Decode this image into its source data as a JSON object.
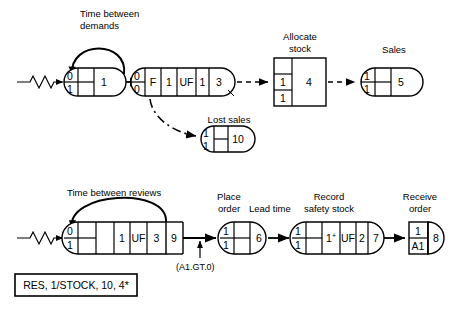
{
  "diagram": {
    "type": "activity-network",
    "labels": {
      "time_between_demands": "Time between\ndemands",
      "time_between_demands_l1": "Time between",
      "time_between_demands_l2": "demands",
      "allocate_stock_l1": "Allocate",
      "allocate_stock_l2": "stock",
      "sales": "Sales",
      "lost_sales": "Lost sales",
      "time_between_reviews": "Time between reviews",
      "place_order_l1": "Place",
      "place_order_l2": "order",
      "lead_time": "Lead time",
      "record_safety_stock_l1": "Record",
      "record_safety_stock_l2": "safety stock",
      "receive_order_l1": "Receive",
      "receive_order_l2": "order",
      "condition": "(A1.GT.0)",
      "resource_block": "RES, 1/STOCK, 10, 4*"
    },
    "nodes": [
      {
        "id": "demand-source",
        "name": "demand-source-node",
        "shape": "rounded-both",
        "row": "top",
        "top_left": "0",
        "bottom_left": "1",
        "cells": [
          "",
          "1"
        ],
        "label": "Time between demands",
        "self_loop": true
      },
      {
        "id": "demand-queue",
        "name": "demand-queue-node",
        "shape": "rounded-both",
        "row": "top",
        "top_left": "0",
        "bottom_left": "0",
        "cells": [
          "F",
          "1",
          "UF",
          "1",
          "3"
        ]
      },
      {
        "id": "allocate-stock",
        "name": "allocate-stock-node",
        "shape": "rectangle",
        "row": "top",
        "left_cells": [
          "",
          "1",
          "1"
        ],
        "right_cell": "4",
        "label": "Allocate stock"
      },
      {
        "id": "sales",
        "name": "sales-node",
        "shape": "rounded-both",
        "row": "top",
        "top_left": "1",
        "bottom_left": "1",
        "cells": [
          "",
          "5"
        ],
        "label": "Sales"
      },
      {
        "id": "lost-sales",
        "name": "lost-sales-node",
        "shape": "rounded-both",
        "row": "top",
        "top_left": "1",
        "bottom_left": "1",
        "cells": [
          "",
          "10"
        ],
        "label": "Lost sales"
      },
      {
        "id": "review-source",
        "name": "review-source-node",
        "shape": "rounded-left",
        "row": "bottom",
        "top_left": "0",
        "bottom_left": "1",
        "cells": [
          "",
          "1",
          "UF",
          "3",
          "9"
        ],
        "label": "Time between reviews",
        "self_loop": true
      },
      {
        "id": "place-order",
        "name": "place-order-node",
        "shape": "rounded-both",
        "row": "bottom",
        "top_left": "1",
        "bottom_left": "1",
        "cells": [
          "",
          "6"
        ],
        "label": "Place order"
      },
      {
        "id": "record-safety-stock",
        "name": "record-safety-stock-node",
        "shape": "rounded-both",
        "row": "bottom",
        "top_left": "1",
        "bottom_left": "1",
        "cells": [
          "",
          "1+",
          "UF",
          "2",
          "7"
        ],
        "label": "Record safety stock"
      },
      {
        "id": "receive-order",
        "name": "receive-order-node",
        "shape": "square-plus-halfcircle",
        "row": "bottom",
        "top_left": "1",
        "bottom_left": "A1",
        "cells": [
          "8"
        ],
        "label": "Receive order"
      }
    ],
    "edges": [
      {
        "from": "source-squiggle-top",
        "to": "demand-source",
        "style": "solid"
      },
      {
        "from": "demand-source",
        "to": "demand-queue",
        "style": "solid"
      },
      {
        "from": "demand-queue",
        "to": "allocate-stock",
        "style": "dashed"
      },
      {
        "from": "allocate-stock",
        "to": "sales",
        "style": "dashed"
      },
      {
        "from": "demand-queue",
        "to": "lost-sales",
        "style": "dash-dot"
      },
      {
        "from": "source-squiggle-bottom",
        "to": "review-source",
        "style": "solid"
      },
      {
        "from": "review-source",
        "to": "place-order",
        "style": "solid",
        "label": "(A1.GT.0)"
      },
      {
        "from": "place-order",
        "to": "record-safety-stock",
        "style": "solid",
        "label": "Lead time"
      },
      {
        "from": "record-safety-stock",
        "to": "receive-order",
        "style": "solid"
      }
    ]
  }
}
